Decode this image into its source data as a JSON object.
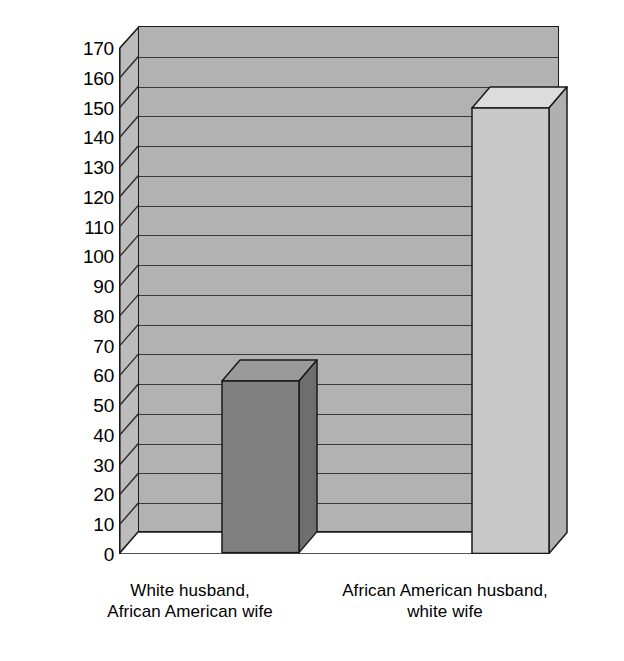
{
  "chart_data": {
    "type": "bar",
    "title": "",
    "subtitle": "",
    "xlabel": "",
    "ylabel": "Total in thousands",
    "categories": [
      "White  husband,\nAfrican American wife",
      "African American husband,\nwhite wife"
    ],
    "category_lines": [
      [
        "White  husband,",
        "African American wife"
      ],
      [
        "African American husband,",
        "white wife"
      ]
    ],
    "values": [
      58,
      150
    ],
    "ylim": [
      0,
      170
    ],
    "ytick_step": 10,
    "yticks": [
      170,
      160,
      150,
      140,
      130,
      120,
      110,
      100,
      90,
      80,
      70,
      60,
      50,
      40,
      30,
      20,
      10,
      0
    ],
    "ytick_labels": [
      "170",
      "160",
      "150",
      "140",
      "130",
      "120",
      "110",
      "100",
      "90",
      "80",
      "70",
      "60",
      "50",
      "40",
      "30",
      "20",
      "10",
      "0"
    ],
    "grid": true,
    "grid_orientation": "horizontal",
    "legend": false,
    "legend_position": "none",
    "style": "3d-bar",
    "bar_colors": [
      "#808080",
      "#c8c8c8"
    ],
    "bar_top_colors": [
      "#9a9a9a",
      "#dcdcdc"
    ],
    "bar_side_colors": [
      "#6e6e6e",
      "#b0b0b0"
    ],
    "plot_background": "#b2b2b2",
    "side_wall_color": "#bcbcbc",
    "gridline_color": "#3a3a3a",
    "outline_color": "#1a1a1a",
    "page_background": "#ffffff",
    "text_color": "#000000"
  }
}
